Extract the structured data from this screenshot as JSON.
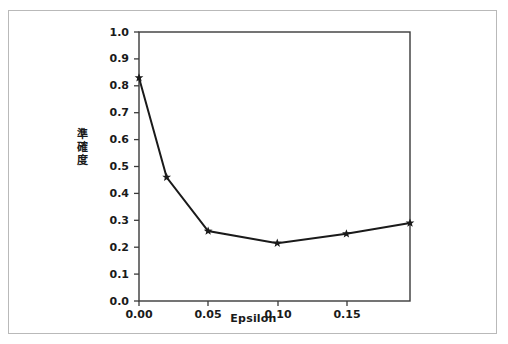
{
  "chart_data": {
    "type": "line",
    "title": "",
    "xlabel": "Epsilon",
    "ylabel": "準確度",
    "ylabel_chars": [
      "準",
      "確",
      "度"
    ],
    "x": [
      0.0,
      0.02,
      0.05,
      0.1,
      0.15,
      0.196
    ],
    "values": [
      0.83,
      0.46,
      0.26,
      0.215,
      0.25,
      0.29
    ],
    "series": [
      {
        "name": "Accuracy vs Epsilon",
        "x": [
          0.0,
          0.02,
          0.05,
          0.1,
          0.15,
          0.196
        ],
        "values": [
          0.83,
          0.46,
          0.26,
          0.215,
          0.25,
          0.29
        ]
      }
    ],
    "xlim": [
      0.0,
      0.196
    ],
    "ylim": [
      0.0,
      1.0
    ],
    "xticks": [
      0.0,
      0.05,
      0.1,
      0.15
    ],
    "xtick_labels": [
      "0.00",
      "0.05",
      "0.10",
      "0.15"
    ],
    "yticks": [
      0.0,
      0.1,
      0.2,
      0.3,
      0.4,
      0.5,
      0.6,
      0.7,
      0.8,
      0.9,
      1.0
    ],
    "ytick_labels": [
      "0.0",
      "0.1",
      "0.2",
      "0.3",
      "0.4",
      "0.5",
      "0.6",
      "0.7",
      "0.8",
      "0.9",
      "1.0"
    ],
    "grid": false,
    "legend": null,
    "marker": "star",
    "line_color": "#1a1a1a",
    "marker_color": "#1a1a1a",
    "background_color": "#ffffff",
    "border_color": "#b9b9b9"
  }
}
